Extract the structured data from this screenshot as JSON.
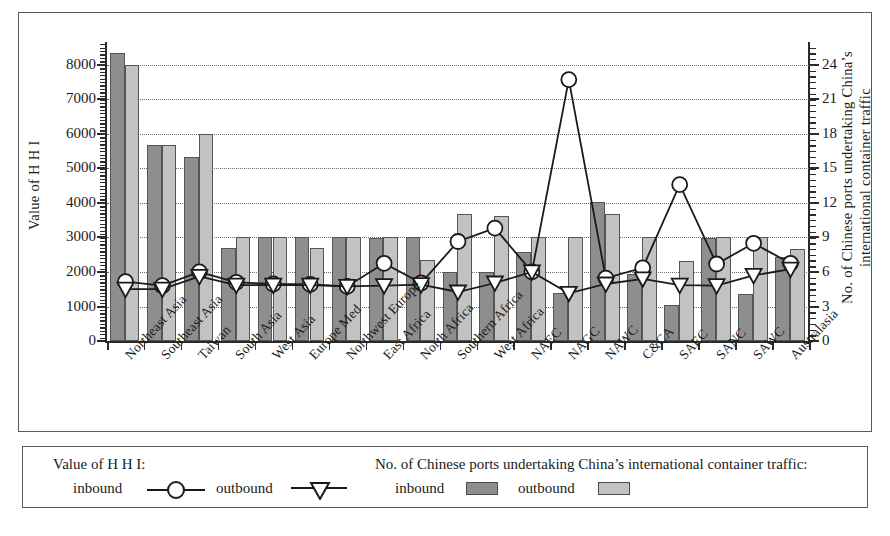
{
  "axes": {
    "left_title": "Value of  H H I",
    "right_title_line1": "No. of Chinese ports undertaking China’s",
    "right_title_line2": "international container traffic",
    "left_ticks": [
      "8000",
      "7000",
      "6000",
      "5000",
      "4000",
      "3000",
      "2000",
      "1000",
      "0"
    ],
    "right_ticks": [
      "24",
      "21",
      "18",
      "15",
      "12",
      "9",
      "6",
      "3",
      "0"
    ],
    "left_min": 0,
    "left_max": 8600,
    "right_min": 0,
    "right_max": 25.8
  },
  "legend": {
    "group1_title": "Value of  H H I:",
    "group1_items": [
      {
        "label": "inbound",
        "symbol": "circle-marker"
      },
      {
        "label": "outbound",
        "symbol": "triangle-marker"
      }
    ],
    "group2_title": "No. of Chinese ports undertaking China’s international container traffic:",
    "group2_items": [
      {
        "label": "inbound",
        "symbol": "dark-swatch"
      },
      {
        "label": "outbound",
        "symbol": "light-swatch"
      }
    ]
  },
  "colors": {
    "inbound_bar": "#8e8e8e",
    "outbound_bar": "#c2c2c2",
    "line": "#1a1a1a",
    "frame": "#5a5a5a",
    "grid": "#6b6b6b"
  },
  "chart_data": {
    "type": "bar",
    "title": "",
    "xlabel": "",
    "ylabel": "Value of  H H I",
    "y2label": "No. of Chinese ports undertaking China’s international container traffic",
    "ylim": [
      0,
      8600
    ],
    "y2lim": [
      0,
      25.8
    ],
    "grid": true,
    "legend_position": "bottom",
    "categories": [
      "Northeast Asia",
      "Southeast Asia",
      "Taiwan",
      "South Asia",
      "West Asia",
      "Europe Med",
      "Northwest Europe",
      "East Africa",
      "North Africa",
      "Southern Africa",
      "West Africa",
      "NAEC",
      "NAGC",
      "NAWC",
      "C&CA",
      "SAEC",
      "SANC",
      "SAWC",
      "Australasia"
    ],
    "series": [
      {
        "name": "No. of Chinese ports undertaking China's international container traffic - inbound",
        "kind": "bar",
        "axis": "right",
        "style": "dark-grey",
        "values": [
          8350,
          5680,
          5320,
          2680,
          3000,
          3000,
          3000,
          2980,
          3000,
          2000,
          2000,
          2580,
          1380,
          4030,
          1950,
          1030,
          2980,
          1350,
          2420
        ]
      },
      {
        "name": "No. of Chinese ports undertaking China's international container traffic - outbound",
        "kind": "bar",
        "axis": "right",
        "style": "light-grey",
        "values": [
          8000,
          5680,
          6000,
          3000,
          3000,
          2680,
          3000,
          3000,
          2350,
          3680,
          3620,
          3000,
          3000,
          3670,
          3000,
          2320,
          3000,
          3000,
          2670
        ]
      },
      {
        "name": "Value of HHI - inbound",
        "kind": "line",
        "axis": "left",
        "marker": "circle",
        "values": [
          1720,
          1600,
          2000,
          1700,
          1650,
          1640,
          1580,
          2250,
          1680,
          2880,
          3270,
          2000,
          7570,
          1820,
          2120,
          4530,
          2230,
          2830,
          2250
        ]
      },
      {
        "name": "Value of HHI - outbound",
        "kind": "line",
        "axis": "left",
        "marker": "triangle",
        "values": [
          1500,
          1500,
          1870,
          1620,
          1620,
          1620,
          1580,
          1600,
          1630,
          1420,
          1680,
          2000,
          1380,
          1650,
          1800,
          1620,
          1600,
          1900,
          2080
        ]
      }
    ]
  }
}
